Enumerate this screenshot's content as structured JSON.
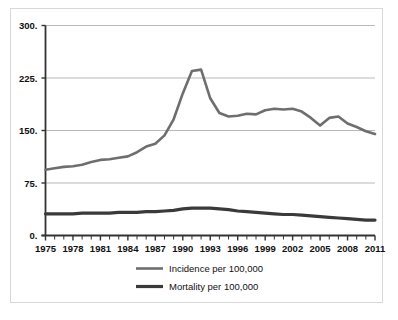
{
  "chart_data": {
    "type": "line",
    "title": "",
    "xlabel": "",
    "ylabel": "",
    "xlim": [
      1975,
      2011
    ],
    "ylim": [
      0,
      300
    ],
    "grid": true,
    "gridlines_y": [
      0,
      75,
      150,
      225,
      300
    ],
    "y_ticks": [
      "0.",
      "75.",
      "150.",
      "225.",
      "300."
    ],
    "y_tick_values": [
      0,
      75,
      150,
      225,
      300
    ],
    "x_ticks": [
      "1975",
      "1978",
      "1981",
      "1984",
      "1987",
      "1990",
      "1993",
      "1996",
      "1999",
      "2002",
      "2005",
      "2008",
      "2011"
    ],
    "x_tick_values": [
      1975,
      1978,
      1981,
      1984,
      1987,
      1990,
      1993,
      1996,
      1999,
      2002,
      2005,
      2008,
      2011
    ],
    "x_minor_ticks_every": 1,
    "legend_position": "bottom",
    "x": [
      1975,
      1976,
      1977,
      1978,
      1979,
      1980,
      1981,
      1982,
      1983,
      1984,
      1985,
      1986,
      1987,
      1988,
      1989,
      1990,
      1991,
      1992,
      1993,
      1994,
      1995,
      1996,
      1997,
      1998,
      1999,
      2000,
      2001,
      2002,
      2003,
      2004,
      2005,
      2006,
      2007,
      2008,
      2009,
      2010,
      2011
    ],
    "series": [
      {
        "name": "Incidence per 100,000",
        "color": "#6e6e6e",
        "width": 2.6,
        "values": [
          94,
          96,
          98,
          99,
          101,
          105,
          108,
          109,
          111,
          113,
          119,
          127,
          131,
          143,
          166,
          203,
          235,
          237,
          196,
          175,
          170,
          171,
          174,
          173,
          179,
          181,
          180,
          181,
          177,
          168,
          157,
          168,
          170,
          160,
          155,
          149,
          145
        ]
      },
      {
        "name": "Mortality per 100,000",
        "color": "#3a3a3a",
        "width": 3.2,
        "values": [
          31,
          31,
          31,
          31,
          32,
          32,
          32,
          32,
          33,
          33,
          33,
          34,
          34,
          35,
          36,
          38,
          39,
          39,
          39,
          38,
          37,
          35,
          34,
          33,
          32,
          31,
          30,
          30,
          29,
          28,
          27,
          26,
          25,
          24,
          23,
          22,
          22
        ]
      }
    ],
    "legend": [
      {
        "label": "Incidence per 100,000",
        "color": "#6e6e6e",
        "width": 2.6
      },
      {
        "label": "Mortality per 100,000",
        "color": "#3a3a3a",
        "width": 3.2
      }
    ],
    "colors": {
      "axis": "#333333",
      "grid": "#b8b8b8",
      "frame": "#d8d8d8",
      "background": "#ffffff",
      "text": "#111111"
    }
  }
}
